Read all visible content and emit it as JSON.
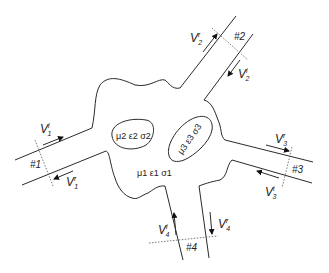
{
  "diagram": {
    "regions": {
      "main": "μ1 ε1 σ1",
      "inclusion_a": "μ2 ε2 σ2",
      "inclusion_b": "μ3 ε3 σ3"
    },
    "ports": [
      {
        "id": "#1",
        "incident": {
          "base": "V",
          "sub": "1",
          "sup": "i"
        },
        "reflected": {
          "base": "V",
          "sub": "1",
          "sup": "r"
        }
      },
      {
        "id": "#2",
        "incident": {
          "base": "V",
          "sub": "2",
          "sup": "i"
        },
        "reflected": {
          "base": "V",
          "sub": "2",
          "sup": "r"
        }
      },
      {
        "id": "#3",
        "incident": {
          "base": "V",
          "sub": "3",
          "sup": "i"
        },
        "reflected": {
          "base": "V",
          "sub": "3",
          "sup": "r"
        }
      },
      {
        "id": "#4",
        "incident": {
          "base": "V",
          "sub": "4",
          "sup": "i"
        },
        "reflected": {
          "base": "V",
          "sub": "4",
          "sup": "r"
        }
      }
    ]
  }
}
